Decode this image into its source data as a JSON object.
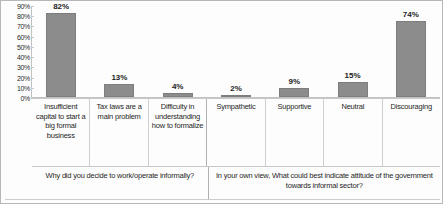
{
  "chart_data": {
    "type": "bar",
    "title": "",
    "xlabel": "",
    "ylabel": "",
    "ylim": [
      0,
      90
    ],
    "grid": false,
    "legend": "none",
    "bar_color": "#8c8c8c",
    "categories": [
      "Insufficient capital to start a big formal business",
      "Tax laws are a main problem",
      "Difficulty in understanding how to formalize",
      "Sympathetic",
      "Supportive",
      "Neutral",
      "Discouraging"
    ],
    "values": [
      82,
      13,
      4,
      2,
      9,
      15,
      74
    ],
    "value_labels": [
      "82%",
      "13%",
      "4%",
      "2%",
      "9%",
      "15%",
      "74%"
    ],
    "ytick_labels": [
      "90%",
      "80%",
      "70%",
      "60%",
      "50%",
      "40%",
      "30%",
      "20%",
      "10%",
      "0%"
    ],
    "ytick_values": [
      90,
      80,
      70,
      60,
      50,
      40,
      30,
      20,
      10,
      0
    ],
    "groups": [
      {
        "label": "Why did you decide to work/operate informally?",
        "span": 3
      },
      {
        "label": "In your own view, What could best indicate attitude of the government towards informal sector?",
        "span": 4
      }
    ]
  }
}
